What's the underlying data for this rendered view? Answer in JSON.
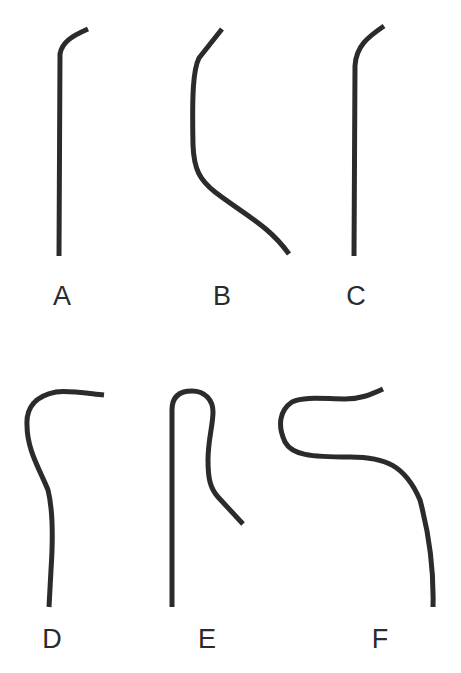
{
  "figure": {
    "stroke_color": "#2b2b2b",
    "background": "#ffffff",
    "panels": [
      {
        "label": "A",
        "label_x": 62,
        "label_y": 305,
        "path": "M88,29 C72,36 62,42 60,54 L59,256"
      },
      {
        "label": "B",
        "label_x": 222,
        "label_y": 305,
        "path": "M222,29 L199,58 C193,70 192,95 193,145 C194,170 200,180 215,192 C245,215 268,225 289,254"
      },
      {
        "label": "C",
        "label_x": 356,
        "label_y": 305,
        "path": "M384,26 C368,37 356,46 355,66 L354,256"
      },
      {
        "label": "D",
        "label_x": 52,
        "label_y": 648,
        "path": "M104,395 C85,393 66,390 56,392 C35,396 26,408 27,425 C27,450 40,470 48,490 C53,510 53,540 51,570 L49,607"
      },
      {
        "label": "E",
        "label_x": 207,
        "label_y": 648,
        "path": "M172,607 L172,410 C172,396 180,391 192,391 C205,391 213,400 213,412 C213,425 208,440 208,460 C208,478 210,488 218,497 L243,524"
      },
      {
        "label": "F",
        "label_x": 380,
        "label_y": 648,
        "path": "M383,389 C370,395 360,399 345,399 C325,399 305,396 292,402 C280,410 277,425 285,442 C292,455 310,457 350,457 C385,457 405,465 420,500 C428,530 434,570 433,607"
      }
    ]
  }
}
